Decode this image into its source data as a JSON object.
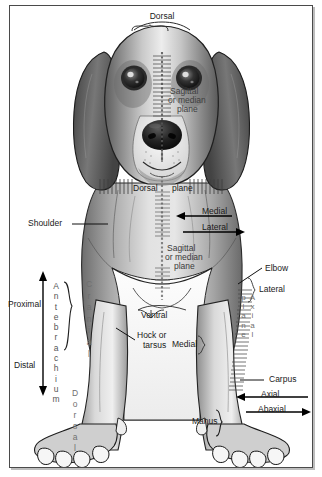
{
  "figure": {
    "species_depicted": "beagle-dog-front-view"
  },
  "labels": {
    "dorsal_top": "Dorsal",
    "sagittal_head": "Sagittal\nor median\nplane",
    "sagittal_head_l1": "Sagittal",
    "sagittal_head_l2": "or median",
    "sagittal_head_l3": "plane",
    "dorsal_plane_word1": "Dorsal",
    "dorsal_plane_word2": "plane",
    "medial_arrow": "Medial",
    "lateral_arrow": "Lateral",
    "sagittal_body_l1": "Sagittal",
    "sagittal_body_l2": "or median",
    "sagittal_body_l3": "plane",
    "shoulder": "Shoulder",
    "elbow": "Elbow",
    "lateral_right": "Lateral",
    "proximal": "Proximal",
    "distal": "Distal",
    "antebrachium": "Antebrachium",
    "cranial": "Cranial",
    "dorsal_paw": "Dorsal",
    "ventral": "Ventral",
    "hock_l1": "Hock or",
    "hock_l2": "tarsus",
    "medial_center": "Medial",
    "axial_plane_vertical": "Axial plane",
    "carpus": "Carpus",
    "axial": "Axial",
    "abaxial": "Abaxial",
    "manus": "Manus"
  },
  "colors": {
    "frame_border": "#4a4a4a",
    "text": "#1a1a1a",
    "text_overlay": "#3a3a3a",
    "arrow": "#111111",
    "fur_dark": "#4e4e4e",
    "fur_mid": "#9a9a9a",
    "fur_light": "#d8d8d8",
    "background": "#ffffff"
  }
}
